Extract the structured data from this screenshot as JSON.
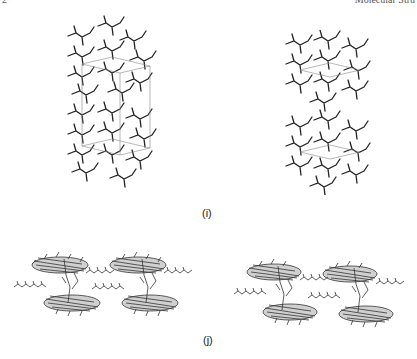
{
  "header": {
    "left_fragment": "2",
    "right_fragment": "Molecular Stru"
  },
  "figure_i": {
    "label": "(i)",
    "description": "Stereo view of crystal packing, hydrogen-bonded network with unit cell outline",
    "views": [
      "left",
      "right"
    ]
  },
  "figure_j": {
    "label": "(j)",
    "description": "Stereo view of crystal packing showing stacked aromatic layers with alkyl chains",
    "views": [
      "left",
      "right"
    ]
  },
  "colors": {
    "ink": "#222222",
    "cell": "#888888"
  }
}
